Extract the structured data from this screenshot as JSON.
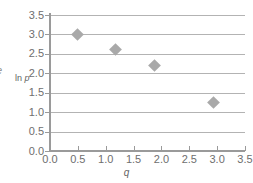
{
  "chart_data": {
    "type": "scatter",
    "title": "",
    "xlabel": "q",
    "ylabel": "ln p",
    "xlim": [
      0.0,
      3.5
    ],
    "ylim": [
      0.0,
      3.5
    ],
    "xticks": [
      "0.0",
      "0.5",
      "1.0",
      "1.5",
      "2.0",
      "2.5",
      "3.0",
      "3.5"
    ],
    "xtick_values": [
      0.0,
      0.5,
      1.0,
      1.5,
      2.0,
      2.5,
      3.0,
      3.5
    ],
    "yticks": [
      "0.0",
      "0.5",
      "1.0",
      "1.5",
      "2.0",
      "2.5",
      "3.0",
      "3.5"
    ],
    "ytick_values": [
      0.0,
      0.5,
      1.0,
      1.5,
      2.0,
      2.5,
      3.0,
      3.5
    ],
    "grid": "horizontal",
    "legend": "none",
    "marker_style": "diamond",
    "marker_color": "#a9a9a9",
    "gridline_color": "#b3b3b3",
    "axis_color": "#9a9a9a",
    "background_color": "#ffffff",
    "points": [
      {
        "q": 0.5,
        "ln_p": 3.0
      },
      {
        "q": 1.17,
        "ln_p": 2.6
      },
      {
        "q": 1.87,
        "ln_p": 2.21
      },
      {
        "q": 2.93,
        "ln_p": 1.26
      }
    ],
    "x": [
      0.5,
      1.17,
      1.87,
      2.93
    ],
    "values": [
      3.0,
      2.6,
      2.21,
      1.26
    ]
  },
  "edge_fragment": {
    "text": "e"
  }
}
